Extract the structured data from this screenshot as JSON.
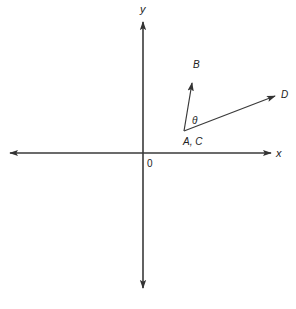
{
  "diagram": {
    "type": "vector-angle-on-axes",
    "colors": {
      "stroke": "#3a3a3a",
      "text": "#222222",
      "background": "#ffffff"
    },
    "axes": {
      "x_label": "x",
      "y_label": "y",
      "origin_label": "0"
    },
    "vectors": [
      {
        "name": "vector-AB",
        "from_label": "A",
        "to_label": "B"
      },
      {
        "name": "vector-CD",
        "from_label": "C",
        "to_label": "D"
      }
    ],
    "labels": {
      "tail_point": "A, C",
      "tip_b": "B",
      "tip_d": "D",
      "angle": "θ"
    }
  }
}
